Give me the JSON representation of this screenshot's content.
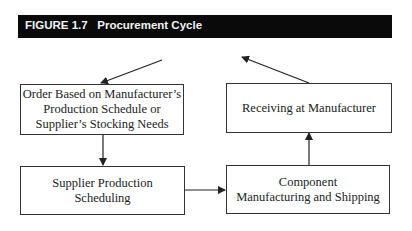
{
  "header": {
    "figure_label": "FIGURE 1.7",
    "title": "Procurement Cycle"
  },
  "nodes": [
    {
      "id": "order",
      "lines": [
        "Order Based on Manufacturer’s",
        "Production Schedule or",
        "Supplier’s Stocking Needs"
      ]
    },
    {
      "id": "supplier-scheduling",
      "lines": [
        "Supplier Production",
        "Scheduling"
      ]
    },
    {
      "id": "component-manufacturing",
      "lines": [
        "Component",
        "Manufacturing and Shipping"
      ]
    },
    {
      "id": "receiving",
      "lines": [
        "Receiving at Manufacturer"
      ]
    }
  ],
  "edges": [
    {
      "from": "header",
      "to": "order"
    },
    {
      "from": "order",
      "to": "supplier-scheduling"
    },
    {
      "from": "supplier-scheduling",
      "to": "component-manufacturing"
    },
    {
      "from": "component-manufacturing",
      "to": "receiving"
    },
    {
      "from": "receiving",
      "to": "header"
    }
  ],
  "colors": {
    "header_bg": "#0a0a0a",
    "header_text": "#f2f2f2",
    "line": "#333333"
  }
}
